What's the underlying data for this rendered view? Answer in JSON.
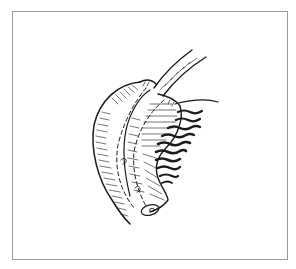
{
  "figure": {
    "kind": "line-drawing",
    "frame": {
      "border_color": "#9a9a9a",
      "background": "#ffffff"
    },
    "ink_color": "#1a1a1a",
    "elements": [
      {
        "name": "curved-organ-body",
        "description": "large crescent-shaped hatched organ"
      },
      {
        "name": "tube",
        "description": "narrow tube entering from top right"
      },
      {
        "name": "dashed-suture-lines",
        "description": "two dashed lines running along the organ"
      },
      {
        "name": "fringed-tissue",
        "description": "dark wavy fringed tissue on the right side"
      },
      {
        "name": "small-openings",
        "description": "small circular openings near bottom"
      }
    ]
  }
}
